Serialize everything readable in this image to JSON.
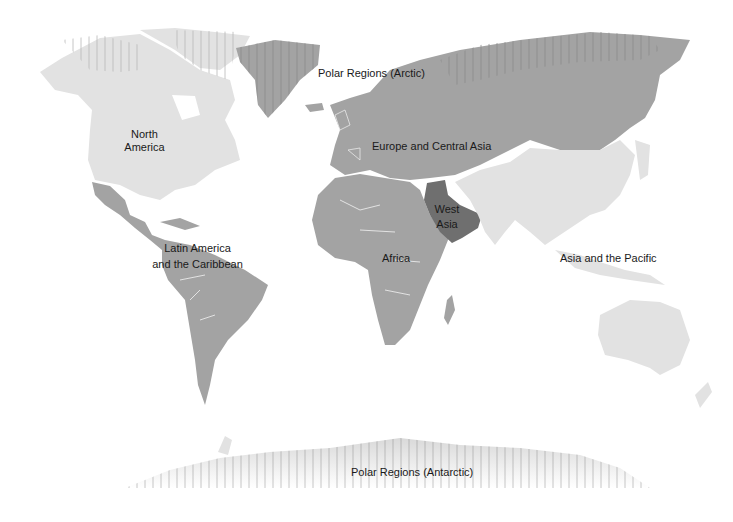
{
  "map": {
    "title": "World regions",
    "colors": {
      "background": "#ffffff",
      "light_region": "#e2e2e2",
      "mid_region": "#a3a3a3",
      "dark_region": "#6f6f6f",
      "borders": "#f2f2f2",
      "hatch": "#8a8a8a"
    },
    "regions": [
      {
        "id": "north-america",
        "label_line1": "North",
        "label_line2": "America",
        "shade": "light"
      },
      {
        "id": "latin-america",
        "label_line1": "Latin America",
        "label_line2": "and the Caribbean",
        "shade": "mid"
      },
      {
        "id": "europe-central-asia",
        "label": "Europe and Central Asia",
        "shade": "mid"
      },
      {
        "id": "africa",
        "label": "Africa",
        "shade": "mid"
      },
      {
        "id": "west-asia",
        "label_line1": "West",
        "label_line2": "Asia",
        "shade": "dark"
      },
      {
        "id": "asia-pacific",
        "label": "Asia and the Pacific",
        "shade": "light"
      },
      {
        "id": "arctic",
        "label": "Polar Regions (Arctic)",
        "shade": "hatched"
      },
      {
        "id": "antarctic",
        "label": "Polar Regions (Antarctic)",
        "shade": "hatched"
      }
    ]
  }
}
